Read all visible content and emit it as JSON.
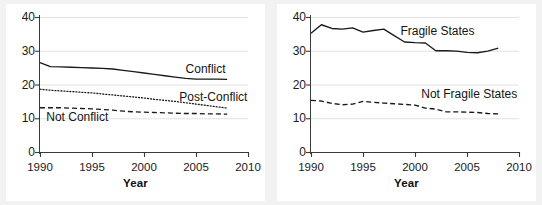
{
  "figure": {
    "panel_count": 2,
    "background": "#f2f2f2",
    "plot_background": "#ffffff",
    "grid_color": "#e2e2e2",
    "line_color": "#1a1a1a"
  },
  "chart_data": [
    {
      "type": "line",
      "panel": "left",
      "title": "",
      "xlabel": "Year",
      "ylabel": "",
      "xlim": [
        1990,
        2010
      ],
      "ylim": [
        0,
        40
      ],
      "xticks": [
        1990,
        1995,
        2000,
        2005,
        2010
      ],
      "xticklabels": [
        "1990",
        "1995",
        "2000",
        "2005",
        "2010"
      ],
      "yticks": [
        0,
        10,
        20,
        30,
        40
      ],
      "yticklabels": [
        "0",
        "10",
        "20",
        "30",
        "40"
      ],
      "grid": "horizontal",
      "legend": "inline-annotations",
      "x": [
        1990,
        1991,
        1992,
        1993,
        1994,
        1995,
        1996,
        1997,
        1998,
        1999,
        2000,
        2001,
        2002,
        2003,
        2004,
        2005,
        2006,
        2007,
        2008
      ],
      "series": [
        {
          "name": "Conflict",
          "style": "solid",
          "label_x": 2004.0,
          "label_y": 24.3,
          "values": [
            26.5,
            25.3,
            25.2,
            25.1,
            25.0,
            24.9,
            24.8,
            24.6,
            24.2,
            23.8,
            23.4,
            23.0,
            22.6,
            22.2,
            21.8,
            21.6,
            21.6,
            21.6,
            21.5
          ]
        },
        {
          "name": "Post-Conflict",
          "style": "dotted",
          "label_x": 2003.4,
          "label_y": 16.0,
          "values": [
            18.6,
            18.3,
            18.1,
            17.9,
            17.7,
            17.5,
            17.2,
            16.9,
            16.6,
            16.3,
            16.0,
            15.6,
            15.3,
            15.0,
            14.6,
            14.2,
            13.8,
            13.4,
            13.0
          ]
        },
        {
          "name": "Not Conflict",
          "style": "dashed",
          "label_x": 1990.6,
          "label_y": 10.2,
          "values": [
            13.1,
            13.1,
            13.1,
            13.0,
            12.9,
            12.8,
            12.6,
            12.4,
            12.1,
            11.9,
            11.8,
            11.7,
            11.6,
            11.5,
            11.4,
            11.4,
            11.3,
            11.3,
            11.2
          ]
        }
      ]
    },
    {
      "type": "line",
      "panel": "right",
      "title": "",
      "xlabel": "Year",
      "ylabel": "",
      "xlim": [
        1990,
        2010
      ],
      "ylim": [
        0,
        40
      ],
      "xticks": [
        1990,
        1995,
        2000,
        2005,
        2010
      ],
      "xticklabels": [
        "1990",
        "1995",
        "2000",
        "2005",
        "2010"
      ],
      "yticks": [
        0,
        10,
        20,
        30,
        40
      ],
      "yticklabels": [
        "0",
        "10",
        "20",
        "30",
        "40"
      ],
      "grid": "horizontal",
      "legend": "inline-annotations",
      "x": [
        1990,
        1991,
        1992,
        1993,
        1994,
        1995,
        1996,
        1997,
        1998,
        1999,
        2000,
        2001,
        2002,
        2003,
        2004,
        2005,
        2006,
        2007,
        2008
      ],
      "series": [
        {
          "name": "Fragile States",
          "style": "solid",
          "label_x": 1998.6,
          "label_y": 35.6,
          "values": [
            35.2,
            37.7,
            36.6,
            36.4,
            36.8,
            35.5,
            36.0,
            36.4,
            34.5,
            32.6,
            32.4,
            32.3,
            30.0,
            30.0,
            29.9,
            29.5,
            29.4,
            29.9,
            30.8
          ]
        },
        {
          "name": "Not Fragile States",
          "style": "dashed",
          "label_x": 2000.6,
          "label_y": 16.8,
          "values": [
            15.3,
            15.1,
            14.4,
            14.0,
            14.2,
            15.0,
            14.7,
            14.5,
            14.3,
            14.1,
            13.9,
            13.0,
            12.7,
            11.9,
            11.9,
            11.8,
            11.7,
            11.4,
            11.3
          ]
        }
      ]
    }
  ]
}
